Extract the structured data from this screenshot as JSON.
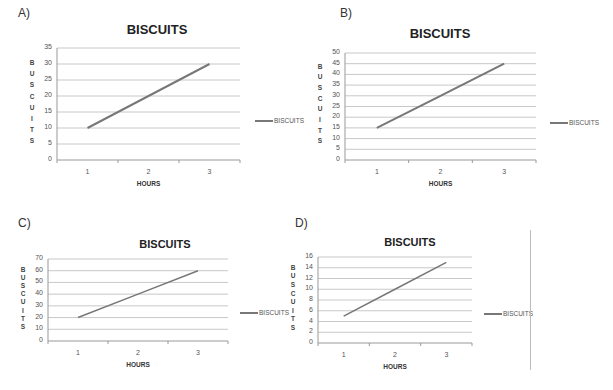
{
  "panels": [
    {
      "label": "A)",
      "title": "BISCUITS",
      "xlabel": "HOURS",
      "ylabel_letters": [
        "B",
        "U",
        "S",
        "C",
        "U",
        "I",
        "T",
        "S"
      ],
      "legend": "BISCUITS"
    },
    {
      "label": "B)",
      "title": "BISCUITS",
      "xlabel": "HOURS",
      "ylabel_letters": [
        "B",
        "U",
        "S",
        "C",
        "U",
        "I",
        "T",
        "S"
      ],
      "legend": "BISCUITS"
    },
    {
      "label": "C)",
      "title": "BISCUITS",
      "xlabel": "HOURS",
      "ylabel_letters": [
        "B",
        "U",
        "S",
        "C",
        "U",
        "I",
        "T",
        "S"
      ],
      "legend": "BISCUITS"
    },
    {
      "label": "D)",
      "title": "BISCUITS",
      "xlabel": "HOURS",
      "ylabel_letters": [
        "B",
        "U",
        "S",
        "C",
        "U",
        "I",
        "T",
        "S"
      ],
      "legend": "BISCUITS"
    }
  ],
  "colors": {
    "line": "#777777",
    "grid": "#c8c8c8",
    "axis": "#999999"
  },
  "chart_data": [
    {
      "panel": "A)",
      "type": "line",
      "title": "BISCUITS",
      "xlabel": "HOURS",
      "ylabel": "BUSCUITS",
      "categories": [
        "1",
        "2",
        "3"
      ],
      "series": [
        {
          "name": "BISCUITS",
          "values": [
            10,
            20,
            30
          ]
        }
      ],
      "ylim": [
        0,
        35
      ],
      "yticks": [
        0,
        5,
        10,
        15,
        20,
        25,
        30,
        35
      ],
      "grid": true,
      "legend_position": "right"
    },
    {
      "panel": "B)",
      "type": "line",
      "title": "BISCUITS",
      "xlabel": "HOURS",
      "ylabel": "BUSCUITS",
      "categories": [
        "1",
        "2",
        "3"
      ],
      "series": [
        {
          "name": "BISCUITS",
          "values": [
            15,
            30,
            45
          ]
        }
      ],
      "ylim": [
        0,
        50
      ],
      "yticks": [
        0,
        5,
        10,
        15,
        20,
        25,
        30,
        35,
        40,
        45,
        50
      ],
      "grid": true,
      "legend_position": "right"
    },
    {
      "panel": "C)",
      "type": "line",
      "title": "BISCUITS",
      "xlabel": "HOURS",
      "ylabel": "BUSCUITS",
      "categories": [
        "1",
        "2",
        "3"
      ],
      "series": [
        {
          "name": "BISCUITS",
          "values": [
            20,
            40,
            60
          ]
        }
      ],
      "ylim": [
        0,
        70
      ],
      "yticks": [
        0,
        10,
        20,
        30,
        40,
        50,
        60,
        70
      ],
      "grid": true,
      "legend_position": "right"
    },
    {
      "panel": "D)",
      "type": "line",
      "title": "BISCUITS",
      "xlabel": "HOURS",
      "ylabel": "BUSCUITS",
      "categories": [
        "1",
        "2",
        "3"
      ],
      "series": [
        {
          "name": "BISCUITS",
          "values": [
            5,
            10,
            15
          ]
        }
      ],
      "ylim": [
        0,
        16
      ],
      "yticks": [
        0,
        2,
        4,
        6,
        8,
        10,
        12,
        14,
        16
      ],
      "grid": true,
      "legend_position": "right"
    }
  ]
}
